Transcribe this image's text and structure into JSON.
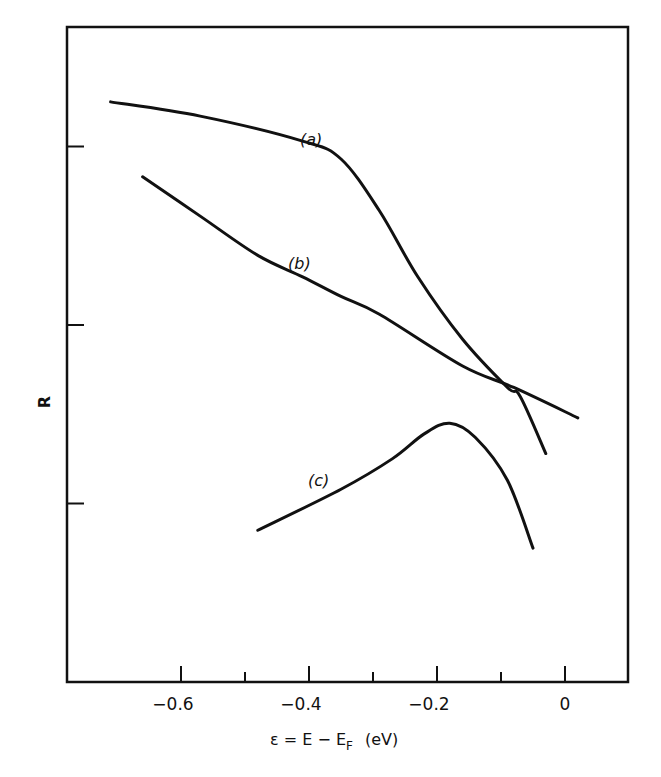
{
  "chart_data": {
    "type": "line",
    "title": "",
    "xlabel": "ε = E − E_F (eV)",
    "xlabel_parts": {
      "main": "ε = E − E",
      "sub": "F",
      "unit": "(eV)"
    },
    "ylabel": "R",
    "xlim": [
      -0.78,
      0.1
    ],
    "ylim": [
      0,
      3.6
    ],
    "x_ticks": [
      -0.6,
      -0.5,
      -0.4,
      -0.3,
      -0.2,
      -0.1,
      0
    ],
    "x_tick_labels": [
      "−0.6",
      "",
      "−0.4",
      "",
      "−0.2",
      "",
      "0"
    ],
    "y_ticks": [
      1,
      2,
      3
    ],
    "y_tick_labels": [
      "",
      "",
      ""
    ],
    "grid": false,
    "legend": "none (curves labeled inline)",
    "series": [
      {
        "name": "(a)",
        "label": "(a)",
        "x": [
          -0.71,
          -0.57,
          -0.41,
          -0.35,
          -0.29,
          -0.23,
          -0.16,
          -0.09,
          -0.07,
          -0.03
        ],
        "y": [
          3.25,
          3.17,
          3.03,
          2.93,
          2.64,
          2.27,
          1.92,
          1.65,
          1.6,
          1.28
        ]
      },
      {
        "name": "(b)",
        "label": "(b)",
        "x": [
          -0.66,
          -0.57,
          -0.48,
          -0.41,
          -0.35,
          -0.29,
          -0.16,
          -0.08,
          0.02
        ],
        "y": [
          2.83,
          2.61,
          2.39,
          2.27,
          2.16,
          2.06,
          1.77,
          1.65,
          1.48
        ]
      },
      {
        "name": "(c)",
        "label": "(c)",
        "x": [
          -0.48,
          -0.35,
          -0.27,
          -0.22,
          -0.18,
          -0.14,
          -0.09,
          -0.05
        ],
        "y": [
          0.85,
          1.08,
          1.25,
          1.39,
          1.45,
          1.37,
          1.13,
          0.75
        ]
      }
    ]
  }
}
